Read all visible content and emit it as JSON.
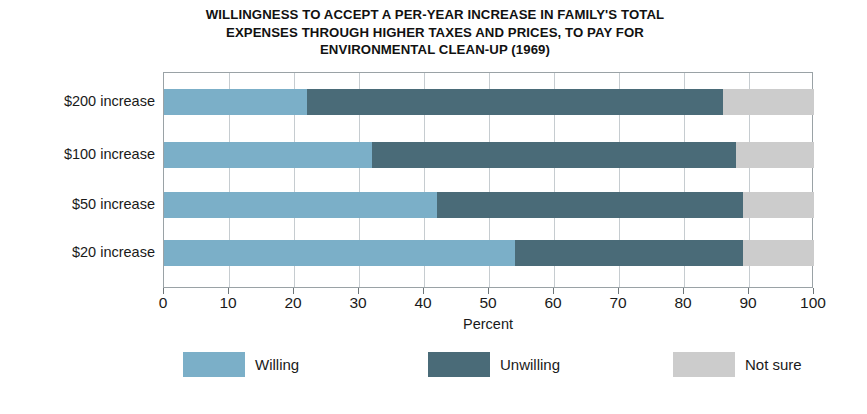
{
  "chart_data": {
    "type": "bar",
    "orientation": "horizontal",
    "stacked": true,
    "title": "WILLINGNESS TO ACCEPT A PER-YEAR INCREASE IN FAMILY'S TOTAL EXPENSES THROUGH HIGHER TAXES AND PRICES, TO PAY FOR ENVIRONMENTAL CLEAN-UP (1969)",
    "title_lines": [
      "WILLINGNESS TO ACCEPT A PER-YEAR INCREASE IN FAMILY'S TOTAL",
      "EXPENSES THROUGH HIGHER TAXES AND PRICES, TO PAY FOR",
      "ENVIRONMENTAL CLEAN-UP (1969)"
    ],
    "xlabel": "Percent",
    "ylabel": "",
    "xlim": [
      0,
      100
    ],
    "xticks": [
      0,
      10,
      20,
      30,
      40,
      50,
      60,
      70,
      80,
      90,
      100
    ],
    "xticklabels": [
      "0",
      "10",
      "20",
      "30",
      "40",
      "50",
      "60",
      "70",
      "80",
      "90",
      "100"
    ],
    "grid": true,
    "grid_axis": "x",
    "legend_position": "bottom",
    "categories": [
      "$200 increase",
      "$100 increase",
      "$50 increase",
      "$20 increase"
    ],
    "series": [
      {
        "name": "Willing",
        "color": "#7bafc8",
        "values": [
          22,
          32,
          42,
          54
        ]
      },
      {
        "name": "Unwilling",
        "color": "#4a6b78",
        "values": [
          64,
          56,
          47,
          35
        ]
      },
      {
        "name": "Not sure",
        "color": "#cccccc",
        "values": [
          14,
          12,
          11,
          11
        ]
      }
    ]
  },
  "legend": {
    "items": [
      {
        "label": "Willing",
        "color": "#7bafc8"
      },
      {
        "label": "Unwilling",
        "color": "#4a6b78"
      },
      {
        "label": "Not sure",
        "color": "#cccccc"
      }
    ]
  }
}
